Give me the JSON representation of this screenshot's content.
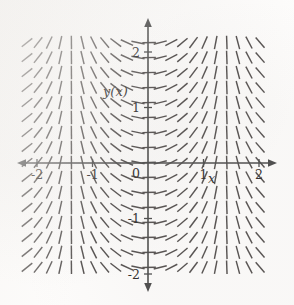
{
  "figure": {
    "kind": "slope-field",
    "background_color": "#fdfcfb",
    "stroke_color": "#555150",
    "axis_color": "#4c4c4c"
  },
  "axes": {
    "x_label": "x",
    "y_label": "y(x)",
    "origin_label": "0",
    "x_ticks": [
      {
        "value": -2,
        "label": "-2"
      },
      {
        "value": -1,
        "label": "-1"
      },
      {
        "value": 1,
        "label": "1"
      },
      {
        "value": 2,
        "label": "2"
      }
    ],
    "y_ticks": [
      {
        "value": 2,
        "label": "2"
      },
      {
        "value": 1,
        "label": "1"
      },
      {
        "value": -1,
        "label": "-1"
      },
      {
        "value": -2,
        "label": "-2"
      }
    ]
  },
  "chart_data": {
    "type": "scatter",
    "title": "",
    "xlabel": "x",
    "ylabel": "y(x)",
    "xlim": [
      -2.35,
      2.35
    ],
    "ylim": [
      -2.35,
      2.35
    ],
    "grid": false,
    "legend": null,
    "slope_rule": "dy/dx = tan(0.72*pi/2*x)",
    "tick_grid": {
      "x_start": -2.18,
      "x_step": 0.2,
      "x_count": 22,
      "y_start": -2.15,
      "y_step": 0.27,
      "y_count": 17,
      "segment_length_px": 13.5
    },
    "sample_slopes": [
      {
        "x": -2.0,
        "slope": -12.7
      },
      {
        "x": -1.6,
        "slope": -3.4
      },
      {
        "x": -1.2,
        "slope": -1.9
      },
      {
        "x": -0.8,
        "slope": -1.18
      },
      {
        "x": -0.4,
        "slope": -0.51
      },
      {
        "x": 0.0,
        "slope": 0.0
      },
      {
        "x": 0.4,
        "slope": 0.51
      },
      {
        "x": 0.8,
        "slope": 1.18
      },
      {
        "x": 1.2,
        "slope": 1.9
      },
      {
        "x": 1.6,
        "slope": 3.4
      },
      {
        "x": 2.0,
        "slope": 12.7
      }
    ]
  }
}
